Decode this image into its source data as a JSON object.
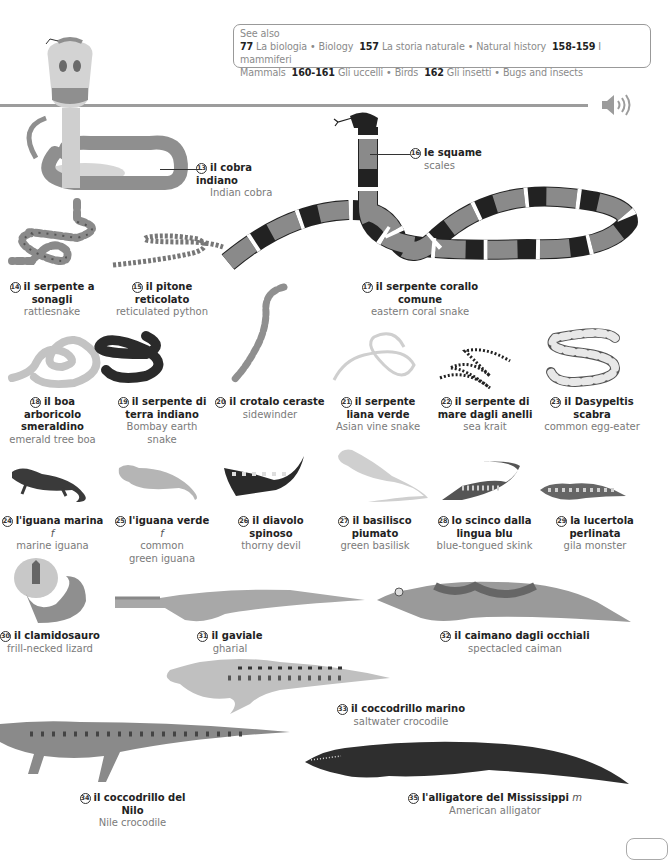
{
  "see_also": {
    "heading": "See also",
    "entries": [
      {
        "page": "77",
        "it": "La biologia",
        "en": "Biology"
      },
      {
        "page": "157",
        "it": "La storia naturale",
        "en": "Natural history"
      },
      {
        "page": "158-159",
        "it": "I mammiferi",
        "en": "Mammals"
      },
      {
        "page": "160-161",
        "it": "Gli uccelli",
        "en": "Birds"
      },
      {
        "page": "162",
        "it": "Gli insetti",
        "en": "Bugs and insects"
      }
    ],
    "separator": "•"
  },
  "audio": {
    "icon": "speaker-icon"
  },
  "colors": {
    "text": "#222222",
    "subtext": "#7a7a7a",
    "rule": "#9c9c9c",
    "border": "#999999"
  },
  "entries": [
    {
      "num": "13",
      "it": "il cobra indiano",
      "en": "Indian cobra"
    },
    {
      "num": "14",
      "it": "il serpente a sonagli",
      "en": "rattlesnake"
    },
    {
      "num": "15",
      "it": "il pitone reticolato",
      "en": "reticulated python"
    },
    {
      "num": "16",
      "it": "le squame",
      "en": "scales"
    },
    {
      "num": "17",
      "it": "il serpente corallo comune",
      "en": "eastern coral snake"
    },
    {
      "num": "18",
      "it": "il boa arboricolo smeraldino",
      "en": "emerald tree boa"
    },
    {
      "num": "19",
      "it": "il serpente di terra indiano",
      "en": "Bombay earth snake"
    },
    {
      "num": "20",
      "it": "il crotalo ceraste",
      "en": "sidewinder"
    },
    {
      "num": "21",
      "it": "il serpente liana verde",
      "en": "Asian vine snake"
    },
    {
      "num": "22",
      "it": "il serpente di mare dagli anelli",
      "en": "sea krait"
    },
    {
      "num": "23",
      "it": "il Dasypeltis scabra",
      "en": "common egg-eater"
    },
    {
      "num": "24",
      "it": "l'iguana marina",
      "gender": "f",
      "en": "marine iguana"
    },
    {
      "num": "25",
      "it": "l'iguana verde",
      "gender": "f",
      "en": "common green iguana"
    },
    {
      "num": "26",
      "it": "il diavolo spinoso",
      "en": "thorny devil"
    },
    {
      "num": "27",
      "it": "il basilisco piumato",
      "en": "green basilisk"
    },
    {
      "num": "28",
      "it": "lo scinco dalla lingua blu",
      "en": "blue-tongued skink"
    },
    {
      "num": "29",
      "it": "la lucertola perlinata",
      "en": "gila monster"
    },
    {
      "num": "30",
      "it": "il clamidosauro",
      "en": "frill-necked lizard"
    },
    {
      "num": "31",
      "it": "il gaviale",
      "en": "gharial"
    },
    {
      "num": "32",
      "it": "il caimano dagli occhiali",
      "en": "spectacled caiman"
    },
    {
      "num": "33",
      "it": "il coccodrillo marino",
      "en": "saltwater crocodile"
    },
    {
      "num": "34",
      "it": "il coccodrillo del Nilo",
      "en": "Nile crocodile"
    },
    {
      "num": "35",
      "it": "l'alligatore del Mississippi",
      "gender": "m",
      "en": "American alligator"
    }
  ]
}
